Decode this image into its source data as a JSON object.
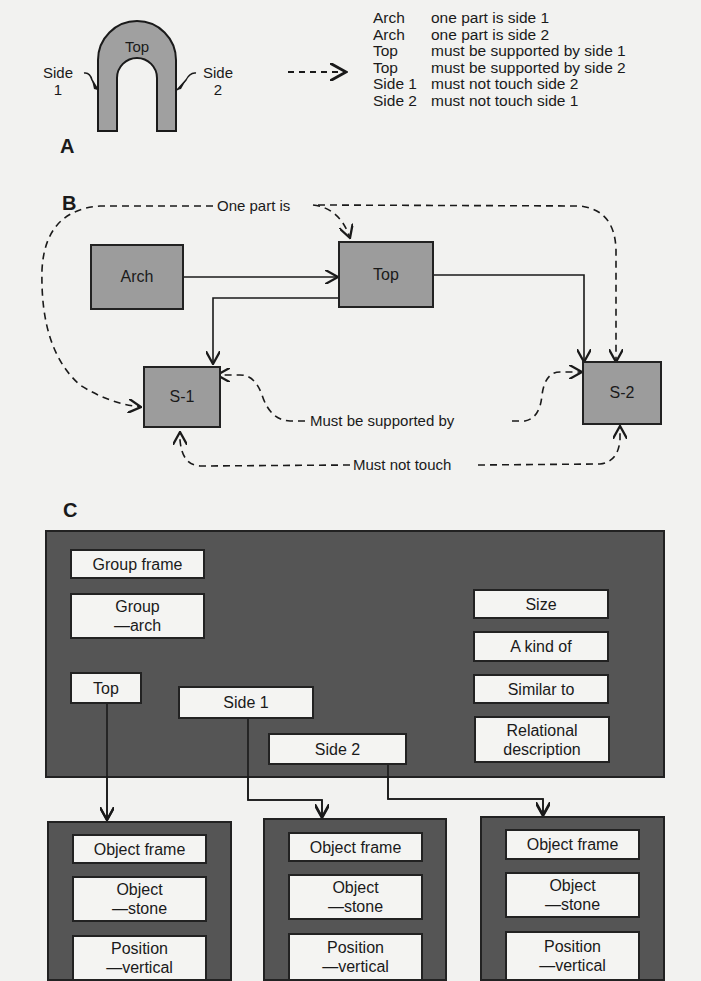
{
  "panel_a": {
    "letter": "A",
    "arch_label": "Top",
    "side1_label_line1": "Side",
    "side1_label_line2": "1",
    "side2_label_line1": "Side",
    "side2_label_line2": "2",
    "arrow_symbol": "- - - >",
    "rules": [
      {
        "subject": "Arch",
        "predicate": "one part is side 1"
      },
      {
        "subject": "Arch",
        "predicate": "one part is side 2"
      },
      {
        "subject": "Top",
        "predicate": "must be supported by side 1"
      },
      {
        "subject": "Top",
        "predicate": "must be supported by side 2"
      },
      {
        "subject": "Side 1",
        "predicate": "must not touch side 2"
      },
      {
        "subject": "Side 2",
        "predicate": "must not touch side 1"
      }
    ]
  },
  "panel_b": {
    "letter": "B",
    "nodes": {
      "arch": "Arch",
      "top": "Top",
      "s1": "S-1",
      "s2": "S-2"
    },
    "edge_labels": {
      "one_part_is": "One part is",
      "must_be_supported_by": "Must be supported by",
      "must_not_touch": "Must not touch"
    }
  },
  "panel_c": {
    "letter": "C",
    "group_frame": {
      "title": "Group frame",
      "group_line1": "Group",
      "group_line2": "—arch",
      "slots": [
        "Size",
        "A kind of",
        "Similar to",
        "Relational description"
      ],
      "relational_line1": "Relational",
      "relational_line2": "description",
      "parts": {
        "top": "Top",
        "side1": "Side 1",
        "side2": "Side 2"
      }
    },
    "object_frames": [
      {
        "title": "Object frame",
        "object_line1": "Object",
        "object_line2": "—stone",
        "position_line1": "Position",
        "position_line2": "—vertical"
      },
      {
        "title": "Object frame",
        "object_line1": "Object",
        "object_line2": "—stone",
        "position_line1": "Position",
        "position_line2": "—vertical"
      },
      {
        "title": "Object frame",
        "object_line1": "Object",
        "object_line2": "—stone",
        "position_line1": "Position",
        "position_line2": "—vertical"
      }
    ]
  },
  "colors": {
    "background": "#f2f2f0",
    "node_gray": "#9c9c9c",
    "frame_dark": "#555555",
    "slot_white": "#f4f4f2",
    "ink": "#1a1a1a"
  }
}
